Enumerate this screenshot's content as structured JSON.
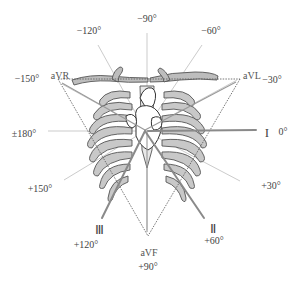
{
  "diagram": {
    "center": {
      "x": 145,
      "y": 130
    },
    "axes": [
      {
        "angle_label": "0°",
        "lead": "I"
      },
      {
        "angle_label": "+30°",
        "lead": ""
      },
      {
        "angle_label": "+60°",
        "lead": "II"
      },
      {
        "angle_label": "+90°",
        "lead": "aVF"
      },
      {
        "angle_label": "+120°",
        "lead": "III"
      },
      {
        "angle_label": "+150°",
        "lead": ""
      },
      {
        "angle_label": "±180°",
        "lead": ""
      },
      {
        "angle_label": "−150°",
        "lead": "aVR"
      },
      {
        "angle_label": "−120°",
        "lead": ""
      },
      {
        "angle_label": "−90°",
        "lead": ""
      },
      {
        "angle_label": "−60°",
        "lead": ""
      },
      {
        "angle_label": "−30°",
        "lead": "aVL"
      }
    ],
    "labels": {
      "m90": "−90°",
      "m120": "−120°",
      "m60": "−60°",
      "m150": "−150°",
      "m30": "−30°",
      "pm180": "±180°",
      "zero": "0°",
      "p30": "+30°",
      "p60": "+60°",
      "p90": "+90°",
      "p120": "+120°",
      "p150": "+150°"
    },
    "leads": {
      "aVR": "aVR",
      "aVL": "aVL",
      "aVF": "aVF",
      "I": "I",
      "II": "Ⅱ",
      "III": "Ⅲ"
    },
    "colors": {
      "axis_line": "#aaaaaa",
      "lead_line": "#888888",
      "triangle": "#666666",
      "bone_fill": "#bdbdbd",
      "outline": "#555555"
    }
  }
}
